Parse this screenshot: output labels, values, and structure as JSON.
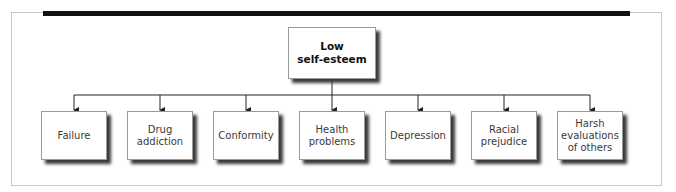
{
  "diagram": {
    "type": "hierarchy",
    "root": {
      "label": "Low\nself-esteem"
    },
    "children": [
      {
        "label": "Failure"
      },
      {
        "label": "Drug\naddiction"
      },
      {
        "label": "Conformity"
      },
      {
        "label": "Health\nproblems"
      },
      {
        "label": "Depression"
      },
      {
        "label": "Racial\nprejudice"
      },
      {
        "label": "Harsh\nevaluations\nof others"
      }
    ],
    "colors": {
      "bar": "#111111",
      "frame": "#c8c8c8",
      "line": "#222222",
      "shadow": "#3a3a3a"
    }
  }
}
